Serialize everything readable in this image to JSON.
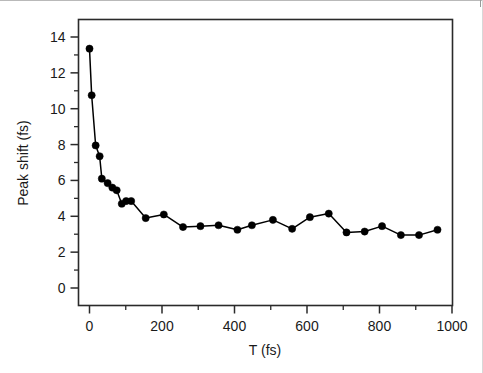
{
  "chart_data": {
    "type": "line",
    "title": "",
    "subtitle": "",
    "xlabel": "T (fs)",
    "ylabel": "Peak shift (fs)",
    "xlim": [
      -40,
      1020
    ],
    "ylim": [
      -1.2,
      15.0
    ],
    "xticks": [
      0,
      200,
      400,
      600,
      800,
      1000
    ],
    "xtick_labels": [
      "0",
      "200",
      "400",
      "600",
      "800",
      "1000"
    ],
    "xminor_ticks": [
      100,
      300,
      500,
      700,
      900
    ],
    "yticks": [
      0,
      2,
      4,
      6,
      8,
      10,
      12,
      14
    ],
    "ytick_labels": [
      "0",
      "2",
      "4",
      "6",
      "8",
      "10",
      "12",
      "14"
    ],
    "yminor_ticks": [
      1,
      3,
      5,
      7,
      9,
      11,
      13,
      15
    ],
    "grid": false,
    "legend": null,
    "marker": "filled-circle",
    "marker_color": "#000000",
    "line_color": "#000000",
    "series": [
      {
        "name": "Peak shift",
        "x": [
          0,
          6,
          17,
          28,
          34,
          50,
          63,
          75,
          89,
          101,
          115,
          155,
          205,
          258,
          306,
          356,
          408,
          448,
          506,
          559,
          608,
          660,
          709,
          759,
          807,
          859,
          909,
          960
        ],
        "y": [
          13.35,
          10.75,
          7.95,
          7.35,
          6.1,
          5.85,
          5.6,
          5.45,
          4.7,
          4.85,
          4.85,
          3.9,
          4.1,
          3.4,
          3.45,
          3.5,
          3.25,
          3.5,
          3.8,
          3.3,
          3.95,
          4.15,
          3.1,
          3.15,
          3.45,
          2.95,
          2.95,
          3.25
        ]
      }
    ],
    "xaxis_tick_direction": "out",
    "yaxis_tick_direction": "out",
    "frame": "box"
  },
  "figure": {
    "background_color": "#ffffff",
    "foreground_color": "#1a1a1a"
  }
}
